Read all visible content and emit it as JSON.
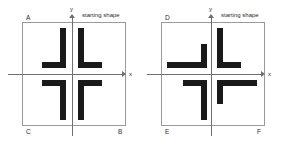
{
  "figure": {
    "type": "geometry-transformation-diagram",
    "panel_count": 2,
    "stroke_color": "#1a1a1a",
    "frame_color": "#9a9a9a",
    "axis_color": "#6f6f6f",
    "background": "#ffffff"
  },
  "panels": [
    {
      "id": "left-panel",
      "caption": "starting shape",
      "axis_x_label": "x",
      "axis_y_label": "y",
      "corner_labels": {
        "top_left": "A",
        "top_right": "",
        "bottom_left": "C",
        "bottom_right": "B"
      },
      "quadrants": [
        {
          "name": "quadrant-1-starting-shape",
          "shape": "L",
          "orientation": "upright-L"
        },
        {
          "name": "quadrant-2-image-A",
          "shape": "L",
          "orientation": "mirrored-L-over-y-axis"
        },
        {
          "name": "quadrant-3-image-C",
          "shape": "L",
          "orientation": "mirrored-L-over-origin"
        },
        {
          "name": "quadrant-4-image-B",
          "shape": "L",
          "orientation": "mirrored-L-over-x-axis"
        }
      ]
    },
    {
      "id": "right-panel",
      "caption": "starting shape",
      "axis_x_label": "x",
      "axis_y_label": "y",
      "corner_labels": {
        "top_left": "D",
        "top_right": "",
        "bottom_left": "E",
        "bottom_right": "F"
      },
      "quadrants": [
        {
          "name": "quadrant-1-starting-shape",
          "shape": "L",
          "orientation": "upright-L"
        },
        {
          "name": "quadrant-2-image-D",
          "shape": "L",
          "orientation": "rotated-90-counterclockwise"
        },
        {
          "name": "quadrant-3-image-E",
          "shape": "L",
          "orientation": "rotated-180"
        },
        {
          "name": "quadrant-4-image-F",
          "shape": "L",
          "orientation": "rotated-270-counterclockwise"
        }
      ]
    }
  ]
}
